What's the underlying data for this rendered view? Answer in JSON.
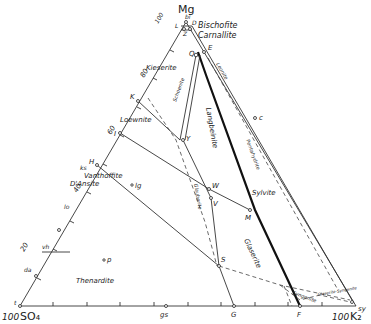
{
  "diagram": {
    "type": "ternary phase diagram",
    "corners": {
      "top": "Mg",
      "bottom_left": "SO4",
      "bottom_left_value": "100",
      "bottom_right": "K2",
      "bottom_right_value": "100",
      "top_value": "100"
    },
    "axis_ticks_left": [
      "100",
      "80",
      "60",
      "40",
      "20"
    ],
    "phase_fields": [
      {
        "name": "Bischofite"
      },
      {
        "name": "Carnallite"
      },
      {
        "name": "Kieserite"
      },
      {
        "name": "Loewnite"
      },
      {
        "name": "Langbeinite"
      },
      {
        "name": "Vanthoffite"
      },
      {
        "name": "D'Ansite"
      },
      {
        "name": "Sylvite"
      },
      {
        "name": "Glaserite"
      },
      {
        "name": "Thenardite"
      },
      {
        "name": "Leonite"
      },
      {
        "name": "Pentahydrite"
      },
      {
        "name": "Glauberite"
      },
      {
        "name": "Schoenite"
      },
      {
        "name": "Syngenite"
      },
      {
        "name": "Glaserite-Syngenite"
      }
    ],
    "points": [
      "bi",
      "L",
      "D",
      "Z",
      "E",
      "Q",
      "K",
      "Y",
      "I",
      "H",
      "ks",
      "lo",
      "lg",
      "vh",
      "p",
      "da",
      "t",
      "W",
      "V",
      "M",
      "S",
      "G",
      "F",
      "gs",
      "sy",
      "c"
    ],
    "labels": {
      "mg": "Mg",
      "so4": "SO₄",
      "k2": "K₂",
      "v100_top": "100",
      "v100_left": "100",
      "v100_right": "100",
      "t80": "80",
      "t60": "60",
      "t40": "40",
      "t20": "20",
      "bischofite": "Bischofite",
      "carnallite": "Carnallite",
      "kieserite": "Kieserite",
      "loewnite": "Loewnite",
      "langbeinite": "Langbeinite",
      "vanthoffite": "Vanthoffite",
      "dansite": "D'Ansite",
      "sylvite": "Sylvite",
      "glaserite": "Glaserite",
      "thenardite": "Thenardite",
      "leonite": "Leonite",
      "pentahydrite": "Pentahydrite",
      "glauberite": "Glauberite",
      "schoenite": "Schoenite",
      "syngenite": "Syngenite",
      "glaser_syn": "Glaserite-Syngenite",
      "bi": "bi",
      "L": "L",
      "D": "D",
      "Z": "Z",
      "E": "E",
      "Q": "Q",
      "K": "K",
      "Y": "Y",
      "I": "I",
      "H": "H",
      "ks": "ks",
      "lo": "lo",
      "lg": "lg",
      "vh": "vh",
      "p": "p",
      "da": "da",
      "t": "t",
      "W": "W",
      "V": "V",
      "M": "M",
      "S": "S",
      "G": "G",
      "F": "F",
      "gs": "gs",
      "sy": "sy",
      "c": "c"
    }
  }
}
